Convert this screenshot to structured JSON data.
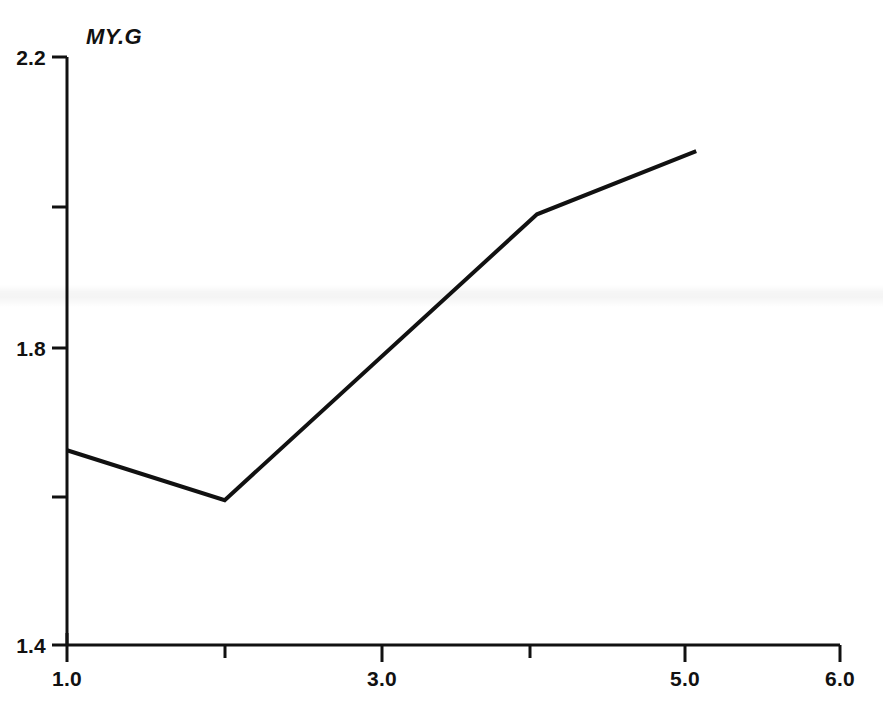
{
  "chart_data": {
    "type": "line",
    "title": "MY.G",
    "xlabel": "",
    "ylabel": "",
    "xlim": [
      1.0,
      6.0
    ],
    "ylim": [
      1.4,
      2.2
    ],
    "grid": false,
    "legend": null,
    "x_major_ticks": [
      "1.0",
      "3.0",
      "5.0",
      "6.0"
    ],
    "x_major_tick_values": [
      1.0,
      3.0,
      5.0,
      6.0
    ],
    "x_minor_tick_values": [
      2.0,
      4.0
    ],
    "y_major_ticks": [
      "2.2",
      "1.8",
      "1.4"
    ],
    "y_major_tick_values": [
      2.2,
      1.8,
      1.4
    ],
    "y_minor_tick_values": [
      2.0,
      1.6
    ],
    "series": [
      {
        "name": "MY.G",
        "color": "#111111",
        "x": [
          1.0,
          2.02,
          4.04,
          5.07
        ],
        "y": [
          1.665,
          1.597,
          1.986,
          2.072
        ]
      }
    ]
  },
  "axis_labels": {
    "y": [
      {
        "text": "2.2",
        "value": 2.2
      },
      {
        "text": "1.8",
        "value": 1.8
      },
      {
        "text": "1.4",
        "value": 1.4
      }
    ],
    "x": [
      {
        "text": "1.0",
        "value": 1.0
      },
      {
        "text": "3.0",
        "value": 3.0
      },
      {
        "text": "5.0",
        "value": 5.0
      },
      {
        "text": "6.0",
        "value": 6.0
      }
    ]
  }
}
